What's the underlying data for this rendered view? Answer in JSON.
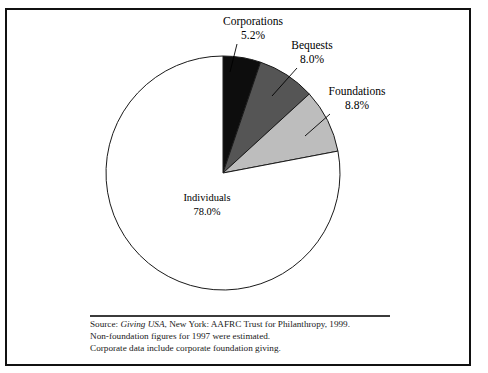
{
  "figure": {
    "frame_color": "#111111",
    "background": "#ffffff"
  },
  "chart_data": {
    "type": "pie",
    "title": "",
    "categories": [
      "Corporations",
      "Bequests",
      "Foundations",
      "Individuals"
    ],
    "values": [
      5.2,
      8.0,
      8.8,
      78.0
    ],
    "value_labels": [
      "5.2%",
      "8.0%",
      "8.8%",
      "78.0%"
    ],
    "units": "percent",
    "start_angle_deg": 0,
    "direction": "clockwise",
    "slice_colors": [
      "#0d0d0d",
      "#555555",
      "#bdbdbd",
      "#ffffff"
    ],
    "slice_stroke": "#1a1a1a",
    "legend": "none",
    "labels_placement": [
      "outside-leader",
      "outside-leader",
      "outside-leader",
      "inside"
    ],
    "slices": [
      {
        "name": "Corporations",
        "value": 5.2,
        "label": "Corporations",
        "value_label": "5.2%",
        "color": "#0d0d0d",
        "label_x": 253,
        "label_y": 22,
        "value_x": 253,
        "value_y": 36,
        "leader_x1": 237,
        "leader_y1": 44,
        "leader_x2": 230,
        "leader_y2": 72
      },
      {
        "name": "Bequests",
        "value": 8.0,
        "label": "Bequests",
        "value_label": "8.0%",
        "color": "#555555",
        "label_x": 312,
        "label_y": 46,
        "value_x": 312,
        "value_y": 60,
        "leader_x1": 297,
        "leader_y1": 68,
        "leader_x2": 272,
        "leader_y2": 96
      },
      {
        "name": "Foundations",
        "value": 8.8,
        "label": "Foundations",
        "value_label": "8.8%",
        "color": "#bdbdbd",
        "label_x": 357,
        "label_y": 92,
        "value_x": 357,
        "value_y": 106,
        "leader_x1": 330,
        "leader_y1": 114,
        "leader_x2": 305,
        "leader_y2": 136
      },
      {
        "name": "Individuals",
        "value": 78.0,
        "label": "Individuals",
        "value_label": "78.0%",
        "color": "#ffffff",
        "label_x": 207,
        "label_y": 199,
        "value_x": 207,
        "value_y": 213
      }
    ],
    "geometry": {
      "center_x": 223,
      "center_y": 173,
      "radius": 117
    }
  },
  "source_note": {
    "line1_prefix": "Source: ",
    "line1_italic": "Giving USA",
    "line1_suffix": ", New York: AAFRC Trust for Philanthropy, 1999.",
    "line2": "Non-foundation figures for 1997 were estimated.",
    "line3": "Corporate data include corporate foundation giving."
  }
}
